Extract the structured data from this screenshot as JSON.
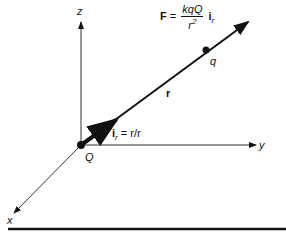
{
  "diagram": {
    "formula": {
      "lhs": "F",
      "equals": "=",
      "numerator": "kqQ",
      "denominator_base": "r",
      "denominator_exp": "2",
      "unit_vector": "i",
      "unit_vector_sub": "r"
    },
    "labels": {
      "z_axis": "z",
      "y_axis": "y",
      "x_axis": "x",
      "origin_charge": "Q",
      "test_charge": "q",
      "position_vector": "r",
      "unit_vector_def_i": "i",
      "unit_vector_def_sub": "r",
      "unit_vector_def_rest": " = r/r"
    },
    "colors": {
      "stroke": "#111111",
      "background": "#ffffff"
    }
  }
}
